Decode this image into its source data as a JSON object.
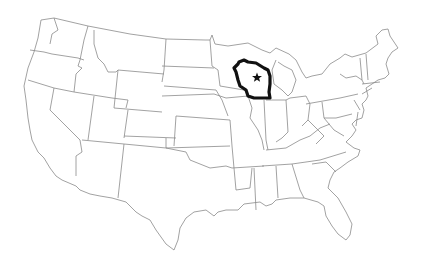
{
  "map": {
    "title": "United States outline map",
    "highlighted_state": "Wisconsin",
    "marker": {
      "type": "star",
      "label": "Wisconsin capital marker (Madison)",
      "x": 257,
      "y": 77
    },
    "colors": {
      "background": "#ffffff",
      "state_border": "#8a8a8a",
      "highlight_border": "#111111",
      "marker": "#111111"
    }
  }
}
